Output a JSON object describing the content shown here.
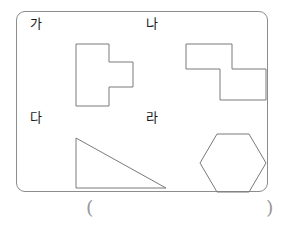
{
  "worksheet": {
    "panel_name": "figures-panel",
    "border_color": "#8d8d8d",
    "shape_stroke_color": "#7a7a7a",
    "label_color": "#1a1a1a"
  },
  "figures": [
    {
      "label": "가",
      "shape": "plus-right-t-polygon",
      "description": "vertical rectangle with rectangular arm extending to the right"
    },
    {
      "label": "나",
      "shape": "s-zigzag-polygon",
      "description": "two offset squares forming an S / Z step shape"
    },
    {
      "label": "다",
      "shape": "right-triangle",
      "description": "right triangle with the right angle at the lower left"
    },
    {
      "label": "라",
      "shape": "hexagon",
      "description": "regular hexagon with flat top and bottom edges"
    }
  ],
  "answer": {
    "open_paren": "(",
    "close_paren": ")"
  }
}
